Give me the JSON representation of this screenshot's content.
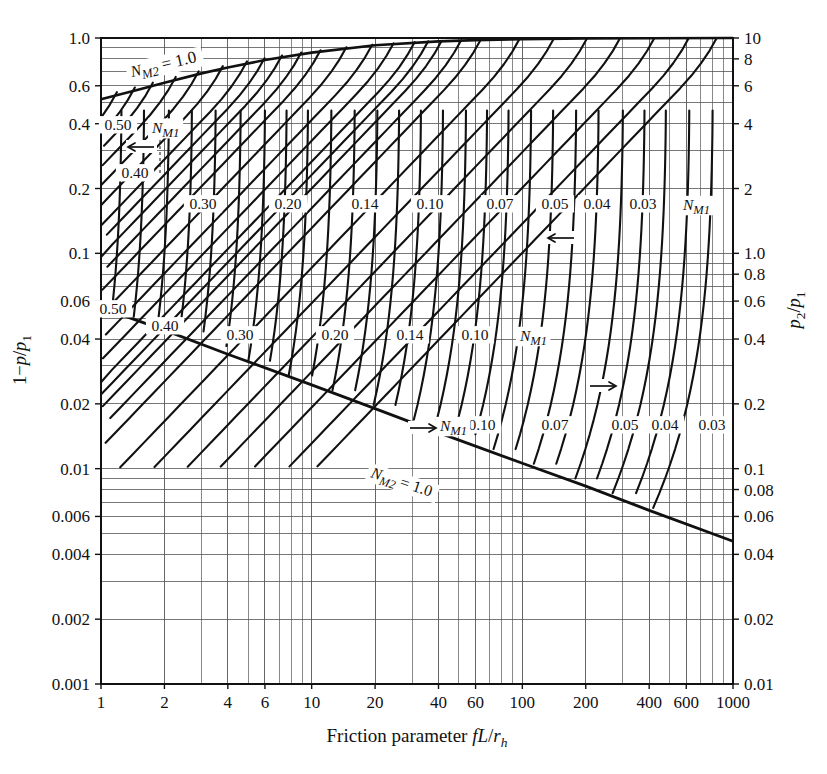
{
  "chart_data": {
    "type": "line",
    "title": "",
    "subtitle": "",
    "xlabel_parts": {
      "prefix": "Friction parameter ",
      "symbol_f": "f",
      "symbol_L": "L",
      "slash": "/",
      "symbol_r": "r",
      "sub_h": "h"
    },
    "xlabel": "Friction parameter fL/r_h",
    "ylabel_left": "1 − p/p₁",
    "ylabel_right": "p₂/p₁",
    "xscale": "log",
    "yscale": "log",
    "xlim": [
      1,
      1000
    ],
    "ylim_left": [
      0.001,
      1.0
    ],
    "ylim_right": [
      0.01,
      10
    ],
    "grid": true,
    "x_ticks": [
      1,
      2,
      4,
      6,
      10,
      20,
      40,
      60,
      100,
      200,
      400,
      600,
      1000
    ],
    "x_tick_labels": [
      "1",
      "2",
      "4",
      "6",
      "10",
      "20",
      "40",
      "60",
      "100",
      "200",
      "400",
      "600",
      "1000"
    ],
    "y_left_ticks": [
      1.0,
      0.6,
      0.4,
      0.2,
      0.1,
      0.06,
      0.04,
      0.02,
      0.01,
      0.006,
      0.004,
      0.002,
      0.001
    ],
    "y_left_tick_labels": [
      "1.0",
      "0.6",
      "0.4",
      "0.2",
      "0.1",
      "0.06",
      "0.04",
      "0.02",
      "0.01",
      "0.006",
      "0.004",
      "0.002",
      "0.001"
    ],
    "y_right_ticks": [
      10,
      8,
      6,
      4,
      2,
      1.0,
      0.8,
      0.6,
      0.4,
      0.2,
      0.1,
      0.08,
      0.06,
      0.04,
      0.02,
      0.01
    ],
    "y_right_tick_labels": [
      "10",
      "8",
      "6",
      "4",
      "2",
      "1.0",
      "0.8",
      "0.6",
      "0.4",
      "0.2",
      "0.1",
      "0.08",
      "0.06",
      "0.04",
      "0.02",
      "0.01"
    ],
    "legend_position": "none",
    "envelope_upper": {
      "name": "N_M2 = 1.0 (upper, left scale)",
      "label": "N",
      "label_sub": "M2",
      "label_eq": "= 1.0",
      "points_xy": [
        [
          1,
          0.52
        ],
        [
          1.5,
          0.575
        ],
        [
          2,
          0.62
        ],
        [
          3,
          0.685
        ],
        [
          4,
          0.73
        ],
        [
          6,
          0.79
        ],
        [
          10,
          0.855
        ],
        [
          20,
          0.925
        ],
        [
          40,
          0.965
        ],
        [
          60,
          0.978
        ],
        [
          100,
          0.988
        ],
        [
          200,
          0.995
        ],
        [
          400,
          0.998
        ],
        [
          1000,
          1.0
        ]
      ]
    },
    "envelope_lower": {
      "name": "N_M2 = 1.0 (lower, right scale)",
      "label": "N",
      "label_sub": "M2",
      "label_eq": "= 1.0",
      "points_xy": [
        [
          1,
          0.56
        ],
        [
          2,
          0.44
        ],
        [
          4,
          0.34
        ],
        [
          10,
          0.245
        ],
        [
          20,
          0.19
        ],
        [
          40,
          0.147
        ],
        [
          100,
          0.106
        ],
        [
          200,
          0.083
        ],
        [
          400,
          0.064
        ],
        [
          1000,
          0.046
        ]
      ]
    },
    "series_upper": {
      "axis": "left",
      "description": "Family of N_M1 curves, upper set, increasing to the right",
      "labels": [
        "0.50",
        "0.40",
        "0.30",
        "0.20",
        "0.14",
        "0.10",
        "0.07",
        "0.05",
        "0.04",
        "0.03"
      ],
      "family_label": "N_M1",
      "family_label_main": "N",
      "family_label_sub": "M1",
      "values": [
        0.5,
        0.4,
        0.3,
        0.2,
        0.14,
        0.1,
        0.07,
        0.05,
        0.04,
        0.03
      ],
      "label_positions_px": [
        {
          "v": "0.50",
          "x": 118,
          "y": 130
        },
        {
          "v": "0.40",
          "x": 135,
          "y": 178
        },
        {
          "v": "0.30",
          "x": 203,
          "y": 209
        },
        {
          "v": "0.20",
          "x": 288,
          "y": 209
        },
        {
          "v": "0.14",
          "x": 365,
          "y": 209
        },
        {
          "v": "0.10",
          "x": 430,
          "y": 209
        },
        {
          "v": "0.07",
          "x": 500,
          "y": 209
        },
        {
          "v": "0.05",
          "x": 555,
          "y": 209
        },
        {
          "v": "0.04",
          "x": 597,
          "y": 209
        },
        {
          "v": "0.03",
          "x": 643,
          "y": 209
        }
      ],
      "family_label_pos_px": {
        "x": 683,
        "y": 210
      },
      "termination_values_x": [
        1.35,
        2.0,
        3.3,
        5.6,
        8.2,
        12.5,
        22,
        35,
        47,
        72
      ]
    },
    "series_lower": {
      "axis": "right",
      "description": "Family of N_M1 curves, lower set, near-vertical at right",
      "labels": [
        "0.50",
        "0.40",
        "0.30",
        "0.20",
        "0.14",
        "0.10",
        "0.07",
        "0.05",
        "0.04",
        "0.03"
      ],
      "family_label": "N_M1",
      "family_label_main": "N",
      "family_label_sub": "M1",
      "values": [
        0.5,
        0.4,
        0.3,
        0.2,
        0.14,
        0.1,
        0.07,
        0.05,
        0.04,
        0.03
      ],
      "label_positions_px": [
        {
          "v": "0.50",
          "x": 113,
          "y": 314
        },
        {
          "v": "0.40",
          "x": 165,
          "y": 331
        },
        {
          "v": "0.30",
          "x": 240,
          "y": 340
        },
        {
          "v": "0.20",
          "x": 335,
          "y": 340
        },
        {
          "v": "0.14",
          "x": 410,
          "y": 340
        },
        {
          "v": "0.10",
          "x": 475,
          "y": 340
        },
        {
          "v": "0.10",
          "x": 482,
          "y": 430
        },
        {
          "v": "0.07",
          "x": 555,
          "y": 430
        },
        {
          "v": "0.05",
          "x": 625,
          "y": 430
        },
        {
          "v": "0.04",
          "x": 665,
          "y": 430
        },
        {
          "v": "0.03",
          "x": 712,
          "y": 430
        }
      ],
      "family_label_pos_px_a": {
        "x": 520,
        "y": 341
      },
      "family_label_pos_px_b": {
        "x": 440,
        "y": 431
      }
    },
    "annotations": [
      {
        "name": "arrow-left-upper",
        "text": "←",
        "x": 128,
        "y": 147,
        "dir": "left"
      },
      {
        "name": "arrow-left-mid",
        "text": "←",
        "x": 548,
        "y": 238,
        "dir": "left"
      },
      {
        "name": "arrow-right-mid",
        "text": "→",
        "x": 590,
        "y": 386,
        "dir": "right"
      },
      {
        "name": "arrow-right-lower",
        "text": "→",
        "x": 410,
        "y": 428,
        "dir": "right"
      }
    ]
  },
  "colors": {
    "curve": "#111111",
    "grid": "#555555",
    "axis": "#111111",
    "background": "#ffffff",
    "text": "#111111"
  }
}
